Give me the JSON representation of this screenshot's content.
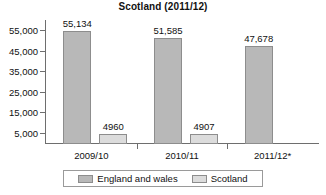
{
  "chart_data": {
    "type": "bar",
    "title": "Scotland (2011/12)",
    "xlabel": "",
    "ylabel": "",
    "categories": [
      "2009/10",
      "2010/11",
      "2011/12*"
    ],
    "series": [
      {
        "name": "England and wales",
        "color": "#b8b8b8",
        "values": [
          55134,
          51585,
          47678
        ],
        "labels": [
          "55,134",
          "51,585",
          "47,678"
        ]
      },
      {
        "name": "Scotland",
        "color": "#dcdcdc",
        "values": [
          4960,
          4907,
          null
        ],
        "labels": [
          "4960",
          "4907",
          ""
        ]
      }
    ],
    "ylim": [
      0,
      60000
    ],
    "yticks": [
      5000,
      15000,
      25000,
      35000,
      45000,
      55000
    ],
    "ytick_labels": [
      "5,000",
      "15,000",
      "25,000",
      "35,000",
      "45,000",
      "55,000"
    ],
    "grid": false,
    "legend_position": "bottom"
  },
  "legend": {
    "entries": [
      {
        "label": "England and wales"
      },
      {
        "label": "Scotland"
      }
    ]
  },
  "colors": {
    "series_england_wales": "#b8b8b8",
    "series_scotland": "#dcdcdc",
    "axis": "#6e6e6e",
    "text": "#111111",
    "background": "#ffffff"
  }
}
